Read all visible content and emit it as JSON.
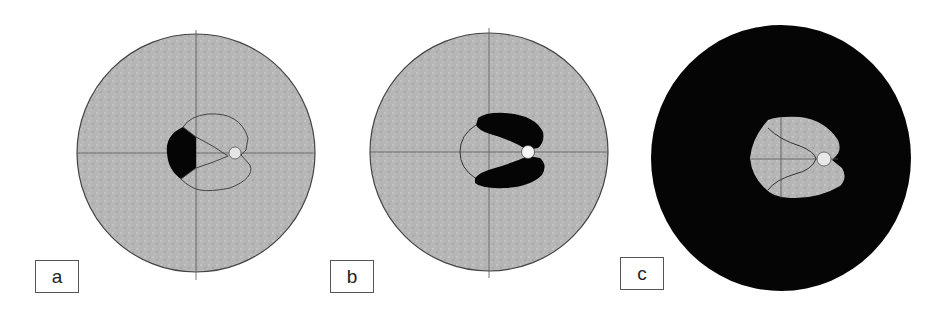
{
  "figure": {
    "panels": [
      {
        "id": "a",
        "label": "a",
        "description": "Gray visual field with crosshair, outlined blind-spot-shaped region, black crescent on left of center, small light circle at right"
      },
      {
        "id": "b",
        "label": "b",
        "description": "Gray visual field with crosshair, black C-shaped region around center opening to the right, thin arc on left, white circle at right"
      },
      {
        "id": "c",
        "label": "c",
        "description": "Black visual field with central gray region, thin curved line and crosshair inside, light circle at right"
      }
    ],
    "colors": {
      "field_gray": "#b4b4b4",
      "outline": "#444444",
      "defect_black": "#050505",
      "spot_light": "#ececec",
      "label_border": "#555555"
    }
  }
}
